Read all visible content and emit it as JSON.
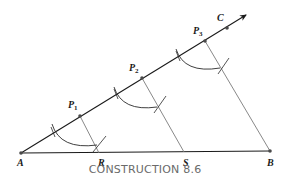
{
  "figure": {
    "caption": "CONSTRUCTION 8.6",
    "colors": {
      "ray": "#1a1a1a",
      "parallel": "#7a7a7a",
      "arc": "#2a2a2a",
      "point": "#4a4a4a",
      "caption": "#6a6a6a"
    },
    "points": {
      "A": {
        "label": "A",
        "x": 21,
        "y": 153
      },
      "R": {
        "label": "R",
        "x": 99,
        "y": 153
      },
      "S": {
        "label": "S",
        "x": 184,
        "y": 152
      },
      "B": {
        "label": "B",
        "x": 270,
        "y": 151
      },
      "P1": {
        "label": "P",
        "sub": "1",
        "x": 80,
        "y": 116
      },
      "P2": {
        "label": "P",
        "sub": "2",
        "x": 142,
        "y": 78
      },
      "P3": {
        "label": "P",
        "sub": "3",
        "x": 205,
        "y": 41
      },
      "C": {
        "label": "C",
        "x": 227,
        "y": 28
      }
    }
  }
}
